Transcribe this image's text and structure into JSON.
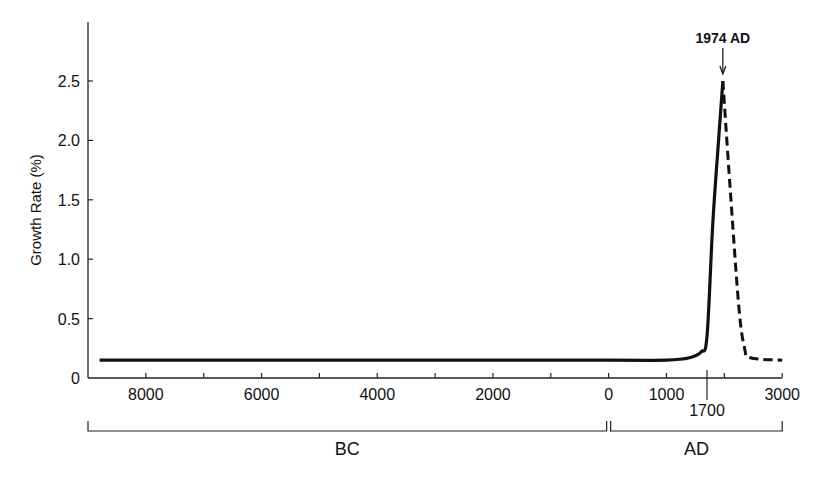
{
  "chart_data": {
    "type": "line",
    "title": "",
    "xlabel": "",
    "ylabel": "Growth Rate (%)",
    "ylim": [
      0,
      3.0
    ],
    "yticks": [
      "0",
      "0.5",
      "1.0",
      "1.5",
      "2.0",
      "2.5"
    ],
    "xticks": [
      {
        "year": -8000,
        "label": "8000"
      },
      {
        "year": -7000,
        "label": ""
      },
      {
        "year": -6000,
        "label": "6000"
      },
      {
        "year": -5000,
        "label": ""
      },
      {
        "year": -4000,
        "label": "4000"
      },
      {
        "year": -3000,
        "label": ""
      },
      {
        "year": -2000,
        "label": "2000"
      },
      {
        "year": -1000,
        "label": ""
      },
      {
        "year": 0,
        "label": "0"
      },
      {
        "year": 1000,
        "label": "1000"
      },
      {
        "year": 1700,
        "label": "1700"
      },
      {
        "year": 2000,
        "label": ""
      },
      {
        "year": 3000,
        "label": "3000"
      }
    ],
    "era_brackets": [
      {
        "label": "BC",
        "from": -9000,
        "to": 0
      },
      {
        "label": "AD",
        "from": 0,
        "to": 3000
      }
    ],
    "annotation": {
      "label": "1974 AD",
      "year": 1974,
      "value": 2.5
    },
    "grid": false,
    "series": [
      {
        "name": "Historical growth rate",
        "style": "solid",
        "points": [
          {
            "year": -8800,
            "value": 0.15
          },
          {
            "year": -4000,
            "value": 0.15
          },
          {
            "year": 0,
            "value": 0.15
          },
          {
            "year": 1000,
            "value": 0.15
          },
          {
            "year": 1400,
            "value": 0.17
          },
          {
            "year": 1600,
            "value": 0.22
          },
          {
            "year": 1700,
            "value": 0.35
          },
          {
            "year": 1800,
            "value": 1.3
          },
          {
            "year": 1900,
            "value": 2.0
          },
          {
            "year": 1974,
            "value": 2.5
          }
        ]
      },
      {
        "name": "Projected growth rate",
        "style": "dashed",
        "points": [
          {
            "year": 1974,
            "value": 2.5
          },
          {
            "year": 2100,
            "value": 1.6
          },
          {
            "year": 2250,
            "value": 0.6
          },
          {
            "year": 2350,
            "value": 0.25
          },
          {
            "year": 2450,
            "value": 0.17
          },
          {
            "year": 3000,
            "value": 0.15
          }
        ]
      }
    ]
  }
}
